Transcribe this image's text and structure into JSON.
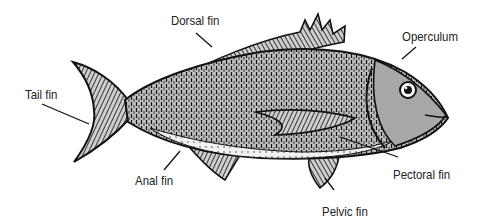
{
  "diagram": {
    "labels": [
      {
        "id": "dorsal",
        "text": "Dorsal fin",
        "x": 171,
        "y": 13
      },
      {
        "id": "operculum",
        "text": "Operculum",
        "x": 402,
        "y": 29
      },
      {
        "id": "tail",
        "text": "Tail fin",
        "x": 25,
        "y": 87
      },
      {
        "id": "anal",
        "text": "Anal fin",
        "x": 135,
        "y": 173
      },
      {
        "id": "pectoral",
        "text": "Pectoral fin",
        "x": 393,
        "y": 167
      },
      {
        "id": "pelvic",
        "text": "Pelvic fin",
        "x": 322,
        "y": 204
      }
    ],
    "colors": {
      "ink": "#111111",
      "body_shade": "#8a8a8a",
      "belly": "#e9e9e9",
      "head_shade": "#9a9a9a",
      "background": "#ffffff"
    }
  }
}
